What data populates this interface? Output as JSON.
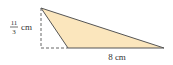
{
  "diagram": {
    "height_label": {
      "numerator": "11",
      "denominator": "3",
      "unit": "cm"
    },
    "base_label": "8 cm",
    "colors": {
      "fill": "#fbe6bd",
      "stroke": "#555555",
      "dash": "#666666"
    }
  }
}
